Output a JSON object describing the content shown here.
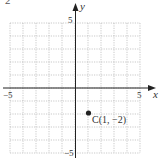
{
  "corner_label": "2",
  "chart_data": {
    "type": "scatter",
    "title": "",
    "xlabel": "x",
    "ylabel": "y",
    "xlim": [
      -5,
      5
    ],
    "ylim": [
      -5,
      5
    ],
    "grid": true,
    "x_ticks_labeled": [
      "-5",
      "5"
    ],
    "y_ticks_labeled": [
      "5",
      "-5"
    ],
    "points": [
      {
        "label": "C(1, −2)",
        "x": 1,
        "y": -2
      }
    ]
  },
  "labels": {
    "x_axis": "x",
    "y_axis": "y",
    "x_min": "−5",
    "x_max": "5",
    "y_max": "5",
    "y_min": "−5",
    "point_c": "C(1, −2)"
  },
  "colors": {
    "grid": "#9a9a9a",
    "axis": "#222222",
    "point": "#222222"
  }
}
